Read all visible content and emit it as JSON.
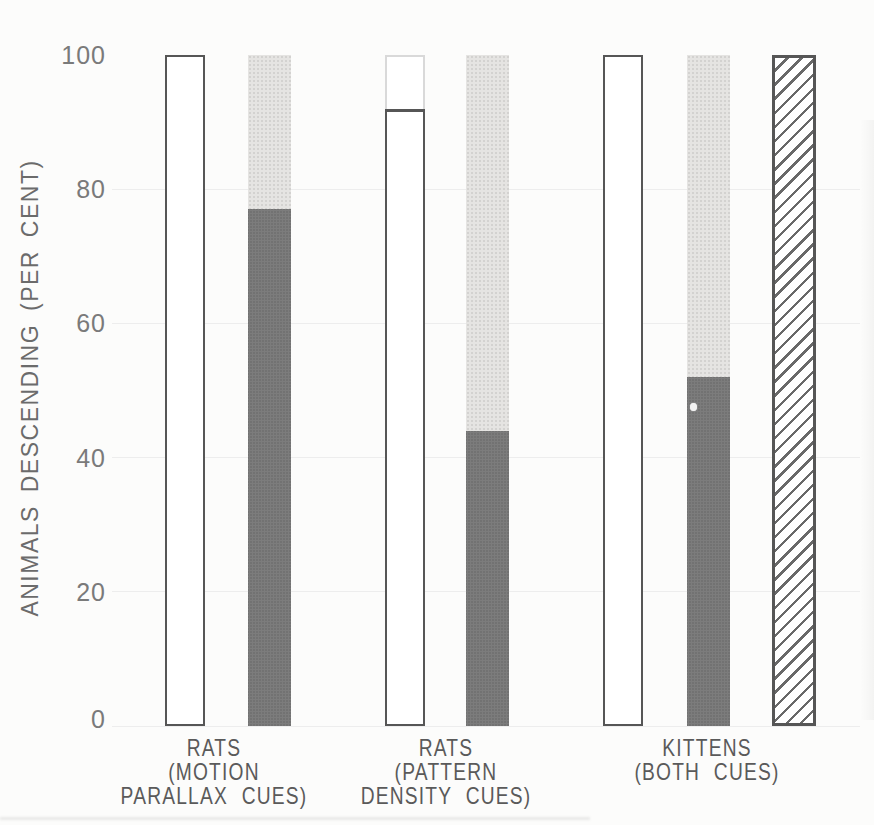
{
  "figure": {
    "kind": "scanned grayscale bar chart",
    "y_axis_title": "ANIMALS DESCENDING (PER CENT)"
  },
  "chart_data": {
    "type": "bar",
    "title": "",
    "xlabel": "",
    "ylabel": "ANIMALS DESCENDING (PER CENT)",
    "ylim": [
      0,
      100
    ],
    "yticks": [
      0,
      20,
      40,
      60,
      80,
      100
    ],
    "grid": "very faint horizontal lines at tick levels",
    "legend": "none",
    "categories": [
      "RATS (MOTION PARALLAX CUES)",
      "RATS (PATTERN DENSITY CUES)",
      "KITTENS (BOTH CUES)"
    ],
    "groups": [
      {
        "label": "RATS (MOTION PARALLAX CUES)",
        "label_lines": [
          "RATS",
          "(MOTION",
          "PARALLAX CUES)"
        ],
        "bars": [
          {
            "kind": "open",
            "value": 100
          },
          {
            "kind": "stacked",
            "dark_value": 77,
            "light_top": 100
          }
        ]
      },
      {
        "label": "RATS (PATTERN DENSITY CUES)",
        "label_lines": [
          "RATS",
          "(PATTERN",
          "DENSITY CUES)"
        ],
        "bars": [
          {
            "kind": "open",
            "value": 92,
            "faint_extension_to": 100
          },
          {
            "kind": "stacked",
            "dark_value": 44,
            "light_top": 100
          }
        ]
      },
      {
        "label": "KITTENS (BOTH CUES)",
        "label_lines": [
          "KITTENS",
          "(BOTH CUES)"
        ],
        "bars": [
          {
            "kind": "open",
            "value": 100
          },
          {
            "kind": "stacked",
            "dark_value": 52,
            "light_top": 100
          },
          {
            "kind": "hatched",
            "value": 100
          }
        ]
      }
    ]
  },
  "colors": {
    "background": "#fcfcfb",
    "bar_outline": "#565656",
    "dark_fill": "#727272",
    "light_fill": "#e5e4e2",
    "hatch_line": "#696969",
    "faint_outline": "#d9d9d9",
    "gridline": "#ededed",
    "tick_text": "#7a7a7a",
    "label_text": "#5a5a5a",
    "axis_title_text": "#6b6b6b"
  }
}
